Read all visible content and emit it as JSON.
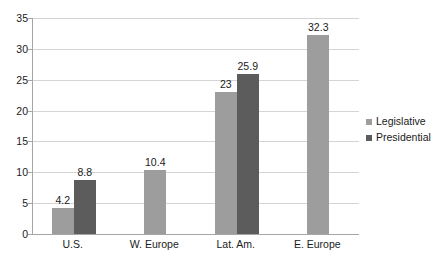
{
  "chart_data": {
    "type": "bar",
    "title": "",
    "subtitle": "",
    "xlabel": "",
    "ylabel": "",
    "categories": [
      "U.S.",
      "W. Europe",
      "Lat. Am.",
      "E. Europe"
    ],
    "series": [
      {
        "name": "Legislative",
        "color": "#9d9d9d",
        "values": [
          4.2,
          10.4,
          23,
          null
        ],
        "labels": [
          "4.2",
          "10.4",
          "23",
          ""
        ]
      },
      {
        "name": "Presidential",
        "color": "#5c5c5c",
        "values": [
          8.8,
          null,
          25.9,
          32.3
        ],
        "labels": [
          "8.8",
          "",
          "25.9",
          "32.3"
        ]
      }
    ],
    "bars": [
      {
        "category": "U.S.",
        "series": "Legislative",
        "value": 4.2,
        "label": "4.2"
      },
      {
        "category": "U.S.",
        "series": "Presidential",
        "value": 8.8,
        "label": "8.8"
      },
      {
        "category": "W. Europe",
        "series": "Legislative",
        "value": 10.4,
        "label": "10.4"
      },
      {
        "category": "Lat. Am.",
        "series": "Legislative",
        "value": 23,
        "label": "23"
      },
      {
        "category": "Lat. Am.",
        "series": "Presidential",
        "value": 25.9,
        "label": "25.9"
      },
      {
        "category": "E. Europe",
        "series": "Legislative",
        "value": 32.3,
        "label": "32.3"
      }
    ],
    "ylim": [
      0,
      35
    ],
    "yticks": [
      0,
      5,
      10,
      15,
      20,
      25,
      30,
      35
    ],
    "ytick_labels": [
      "0",
      "5",
      "10",
      "15",
      "20",
      "25",
      "30",
      "35"
    ],
    "grid": true,
    "grid_color": "#d4d4d4",
    "axis_color": "#a6a6a6",
    "legend": {
      "position": "right",
      "entries": [
        {
          "label": "Legislative",
          "color": "#9d9d9d"
        },
        {
          "label": "Presidential",
          "color": "#5c5c5c"
        }
      ]
    }
  }
}
